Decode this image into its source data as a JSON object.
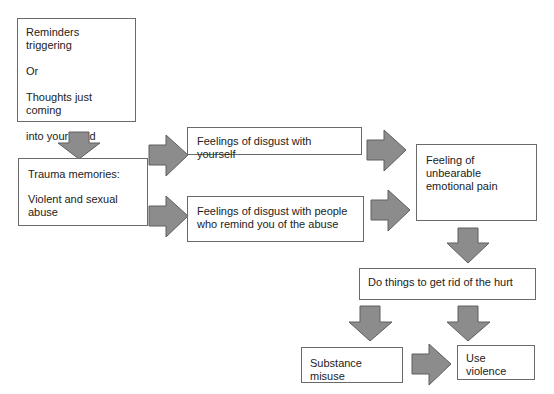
{
  "diagram": {
    "arrow_color": "#8c8c8c",
    "nodes": {
      "triggers": {
        "lines": [
          "Reminders triggering",
          "Or",
          "Thoughts just coming",
          "into your head"
        ]
      },
      "trauma": {
        "title": "Trauma memories:",
        "body": "Violent and sexual\nabuse"
      },
      "disgust_self": {
        "text": "Feelings of disgust with yourself"
      },
      "disgust_others": {
        "text": "Feelings of disgust with people\nwho remind you of the abuse"
      },
      "pain": {
        "text": "Feeling of unbearable\nemotional pain"
      },
      "get_rid": {
        "text": "Do things to get rid of the hurt"
      },
      "substance": {
        "text": "Substance misuse"
      },
      "violence": {
        "text": "Use violence"
      }
    }
  }
}
